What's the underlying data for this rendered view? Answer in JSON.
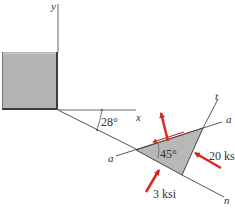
{
  "diagram": {
    "axes": {
      "y_label": "y",
      "x_label": "x",
      "a_label_left": "a",
      "a_label_right": "a",
      "t_label": "t",
      "n_label": "n"
    },
    "angles": {
      "inclination": "28°",
      "element": "45°"
    },
    "stresses": {
      "right_face": "20 ksi",
      "bottom_face": "3 ksi"
    },
    "colors": {
      "arrow": "#d42a1e",
      "block_fill": "#b3b3b3",
      "block_edge": "#4a4a4a",
      "element_fill": "#b8b8b8",
      "line": "#555555"
    }
  }
}
